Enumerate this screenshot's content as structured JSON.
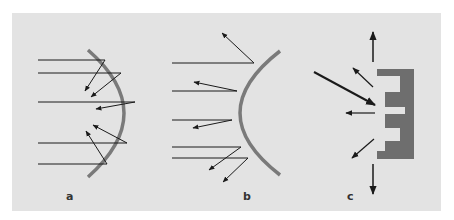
{
  "figure": {
    "background_color": "#e3e3e3",
    "surface_color": "#7a7a7a",
    "ray_color": "#1a1a1a",
    "panels": [
      {
        "id": "a",
        "label": "a",
        "description": "concave reflector focusing parallel rays"
      },
      {
        "id": "b",
        "label": "b",
        "description": "convex reflector scattering parallel rays"
      },
      {
        "id": "c",
        "label": "c",
        "description": "stepped/irregular surface diffusing incident ray"
      }
    ]
  }
}
